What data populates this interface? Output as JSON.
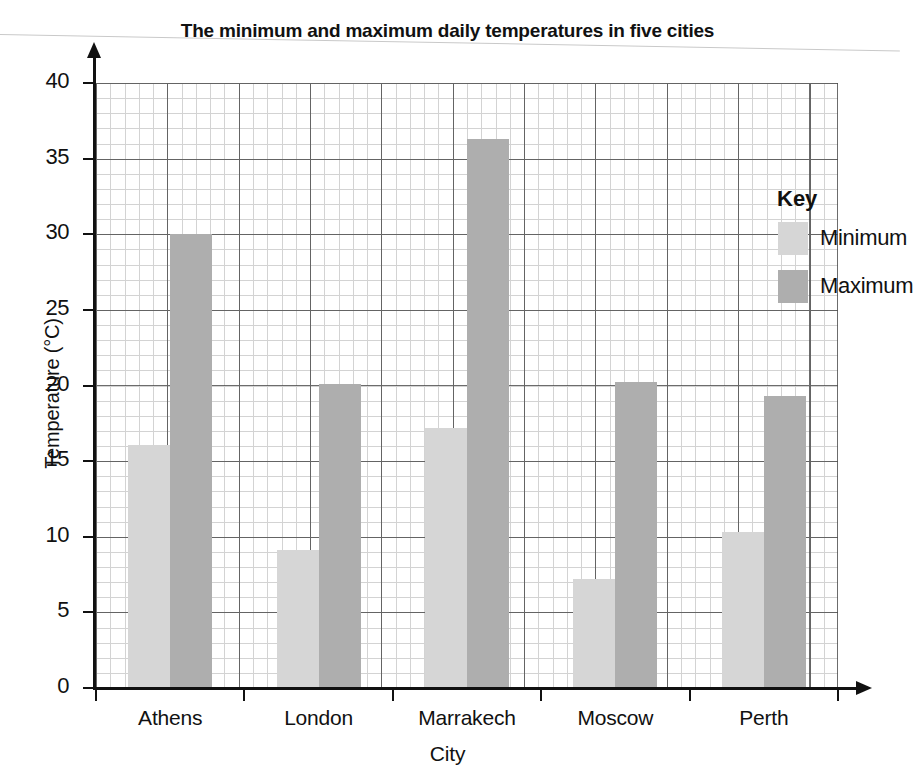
{
  "chart_data": {
    "type": "bar",
    "title": "The minimum and maximum daily temperatures in five cities",
    "xlabel": "City",
    "ylabel": "Temperature (°C)",
    "categories": [
      "Athens",
      "London",
      "Marrakech",
      "Moscow",
      "Perth"
    ],
    "series": [
      {
        "name": "Minimum",
        "color": "#d6d6d6",
        "values": [
          16.1,
          9.1,
          17.2,
          7.2,
          10.3
        ]
      },
      {
        "name": "Maximum",
        "color": "#aeaeae",
        "values": [
          30.0,
          20.1,
          36.3,
          20.2,
          19.3
        ]
      }
    ],
    "ylim": [
      0,
      40
    ],
    "ytick_step": 5,
    "yticks": [
      "0",
      "5",
      "10",
      "15",
      "20",
      "25",
      "30",
      "35",
      "40"
    ],
    "grid": "major and minor gridlines, minor = 1 °C",
    "legend_position": "top-right inside plot"
  },
  "legend": {
    "title": "Key",
    "entries": [
      {
        "label": "Minimum",
        "color": "#d6d6d6"
      },
      {
        "label": "Maximum",
        "color": "#aeaeae"
      }
    ]
  }
}
